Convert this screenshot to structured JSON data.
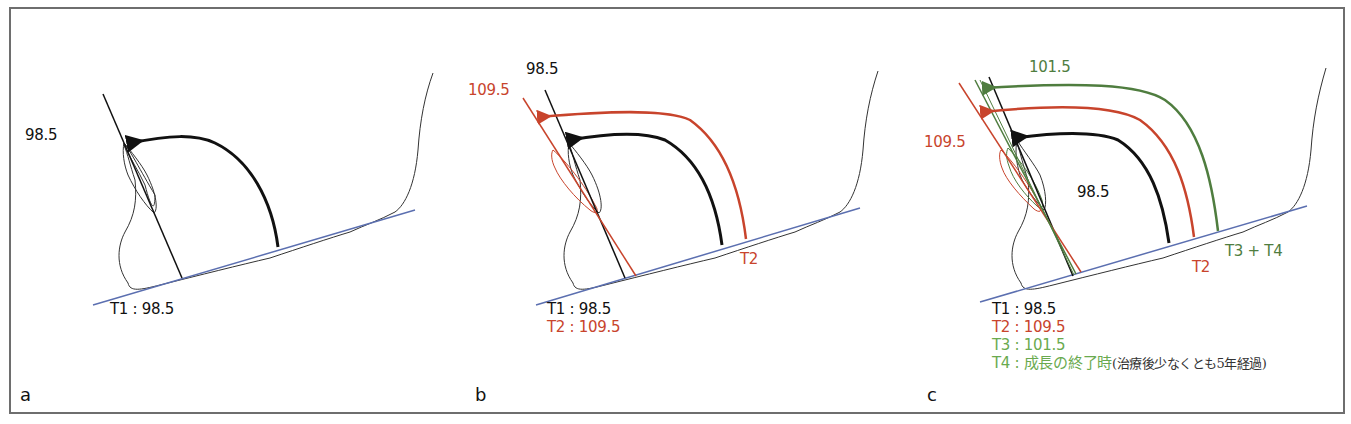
{
  "colors": {
    "t1": "#111111",
    "t2": "#c8442c",
    "t3_line": "#4f7d3f",
    "t3_text": "#6aaa4f",
    "baseline": "#5b6fb0",
    "outline": "#333333",
    "frame": "#6e6e6e"
  },
  "panels": [
    {
      "letter": "a",
      "angle_labels": [
        {
          "text": "98.5",
          "series": "T1"
        }
      ],
      "legend": [
        {
          "text": "T1 : 98.5",
          "series": "T1"
        }
      ]
    },
    {
      "letter": "b",
      "angle_labels": [
        {
          "text": "98.5",
          "series": "T1"
        },
        {
          "text": "109.5",
          "series": "T2"
        }
      ],
      "baseline_labels": [
        {
          "text": "T2",
          "series": "T2"
        }
      ],
      "legend": [
        {
          "text": "T1 : 98.5",
          "series": "T1"
        },
        {
          "text": "T2 : 109.5",
          "series": "T2"
        }
      ]
    },
    {
      "letter": "c",
      "angle_labels": [
        {
          "text": "101.5",
          "series": "T3"
        },
        {
          "text": "109.5",
          "series": "T2"
        },
        {
          "text": "98.5",
          "series": "T1"
        }
      ],
      "baseline_labels": [
        {
          "text": "T2",
          "series": "T2"
        },
        {
          "text": "T3 + T4",
          "series": "T3"
        }
      ],
      "legend": [
        {
          "text": "T1 : 98.5",
          "series": "T1"
        },
        {
          "text": "T2 : 109.5",
          "series": "T2"
        },
        {
          "text": "T3 : 101.5",
          "series": "T3"
        },
        {
          "text": "T4 : 成長の終了時",
          "series": "T4",
          "note": "(治療後少なくとも5年経過)"
        }
      ]
    }
  ]
}
